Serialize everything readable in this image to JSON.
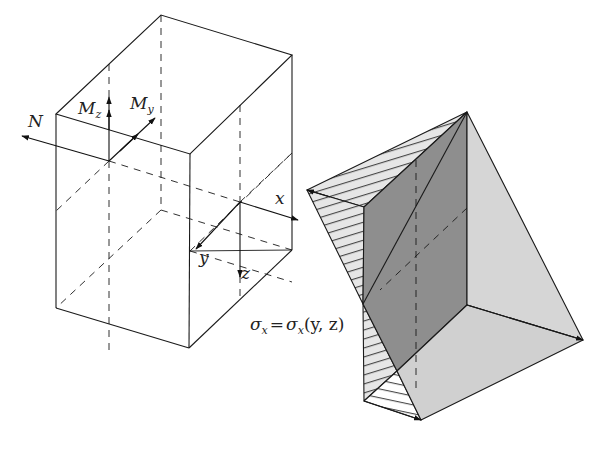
{
  "figure": {
    "colors": {
      "line": "#1a1a1a",
      "dark_face": "#8c8c8c",
      "light_face": "#d4d4d4",
      "hatch_face": "#e6e6e6",
      "background": "#ffffff"
    }
  },
  "labels": {
    "N": "N",
    "Mz_main": "M",
    "Mz_sub": "z",
    "My_main": "M",
    "My_sub": "y",
    "x": "x",
    "y": "y",
    "z": "z",
    "stress_sigma1": "σ",
    "stress_sub1": "x",
    "stress_eq": "=",
    "stress_sigma2": "σ",
    "stress_sub2": "x",
    "stress_args": "(y, z)"
  }
}
